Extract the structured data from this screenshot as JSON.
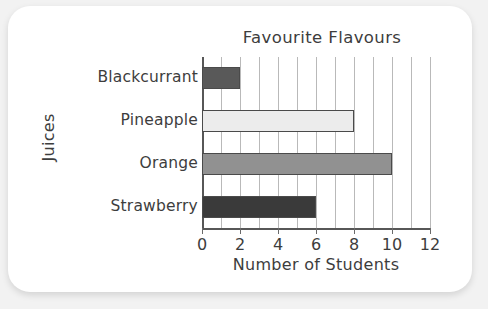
{
  "card": {
    "background": "#ffffff",
    "page_background": "#f2f2f2"
  },
  "chart_data": {
    "type": "bar",
    "orientation": "horizontal",
    "title": "Favourite Flavours",
    "xlabel": "Number of Students",
    "ylabel": "Juices",
    "categories": [
      "Blackcurrant",
      "Pineapple",
      "Orange",
      "Strawberry"
    ],
    "values": [
      2,
      8,
      10,
      6
    ],
    "bar_colors": [
      "#595959",
      "#ececec",
      "#919191",
      "#3a3a3a"
    ],
    "bar_border_color": "#4a4a4a",
    "xlim": [
      0,
      12
    ],
    "xticks": [
      0,
      2,
      4,
      6,
      8,
      10,
      12
    ],
    "xtick_labels": [
      "0",
      "2",
      "4",
      "6",
      "8",
      "10",
      "12"
    ],
    "gridline_values": [
      0,
      1,
      2,
      3,
      4,
      5,
      6,
      7,
      8,
      9,
      10,
      11,
      12
    ],
    "grid": true,
    "grid_color": "#b9b9b9",
    "axis_color": "#575757",
    "legend": null
  }
}
